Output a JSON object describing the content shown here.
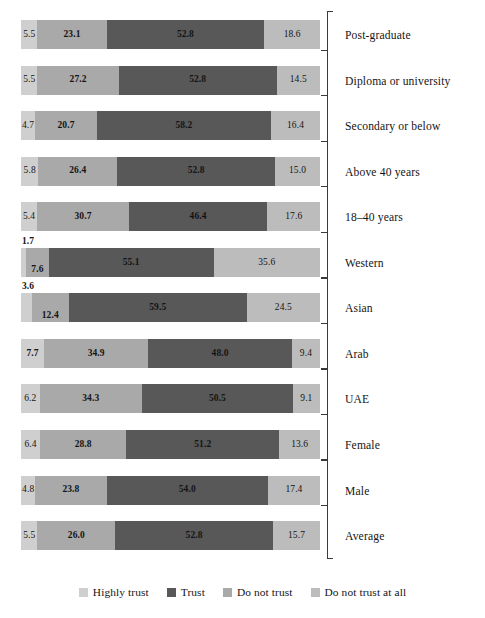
{
  "chart_data": {
    "type": "bar",
    "orientation": "horizontal",
    "stacked": true,
    "stack_mode": "percent",
    "title": "",
    "subtitle": "",
    "xlabel": "",
    "ylabel": "",
    "xlim": [
      0,
      100
    ],
    "grid": false,
    "legend_position": "bottom",
    "categories": [
      "Post-graduate",
      "Diploma or university",
      "Secondary or below",
      "Above 40 years",
      "18–40 years",
      "Western",
      "Asian",
      "Arab",
      "UAE",
      "Female",
      "Male",
      "Average"
    ],
    "series": [
      {
        "name": "Highly trust",
        "color": "#cfcfcf",
        "values": [
          5.5,
          5.5,
          4.7,
          5.8,
          5.4,
          1.7,
          3.6,
          7.7,
          6.2,
          6.4,
          4.8,
          5.5
        ]
      },
      {
        "name": "Trust",
        "color": "#a9a9a9",
        "values": [
          23.1,
          27.2,
          20.7,
          26.4,
          30.7,
          7.6,
          12.4,
          34.9,
          34.3,
          28.8,
          23.8,
          26.0
        ]
      },
      {
        "name": "Do not trust",
        "color": "#585858",
        "values": [
          52.8,
          52.8,
          58.2,
          52.8,
          46.4,
          55.1,
          59.5,
          48.0,
          50.5,
          51.2,
          54.0,
          52.8
        ]
      },
      {
        "name": "Do not trust at all",
        "color": "#bcbcbc",
        "values": [
          18.6,
          14.5,
          16.4,
          15.0,
          17.6,
          35.6,
          24.5,
          9.4,
          9.1,
          13.6,
          17.4,
          15.7
        ]
      }
    ],
    "rows": [
      {
        "label": "Post-graduate",
        "values": [
          {
            "value": "5.5",
            "bold": false,
            "placement": "inside"
          },
          {
            "value": "23.1",
            "bold": true,
            "placement": "inside"
          },
          {
            "value": "52.8",
            "bold": true,
            "placement": "inside"
          },
          {
            "value": "18.6",
            "bold": false,
            "placement": "inside"
          }
        ]
      },
      {
        "label": "Diploma or university",
        "values": [
          {
            "value": "5.5",
            "bold": false,
            "placement": "inside"
          },
          {
            "value": "27.2",
            "bold": true,
            "placement": "inside"
          },
          {
            "value": "52.8",
            "bold": true,
            "placement": "inside"
          },
          {
            "value": "14.5",
            "bold": false,
            "placement": "inside"
          }
        ]
      },
      {
        "label": "Secondary or below",
        "values": [
          {
            "value": "4.7",
            "bold": false,
            "placement": "inside"
          },
          {
            "value": "20.7",
            "bold": true,
            "placement": "inside"
          },
          {
            "value": "58.2",
            "bold": true,
            "placement": "inside"
          },
          {
            "value": "16.4",
            "bold": false,
            "placement": "inside"
          }
        ]
      },
      {
        "label": "Above 40 years",
        "values": [
          {
            "value": "5.8",
            "bold": false,
            "placement": "inside"
          },
          {
            "value": "26.4",
            "bold": true,
            "placement": "inside"
          },
          {
            "value": "52.8",
            "bold": true,
            "placement": "inside"
          },
          {
            "value": "15.0",
            "bold": false,
            "placement": "inside"
          }
        ]
      },
      {
        "label": "18–40 years",
        "values": [
          {
            "value": "5.4",
            "bold": false,
            "placement": "inside"
          },
          {
            "value": "30.7",
            "bold": true,
            "placement": "inside"
          },
          {
            "value": "46.4",
            "bold": true,
            "placement": "inside"
          },
          {
            "value": "17.6",
            "bold": false,
            "placement": "inside"
          }
        ]
      },
      {
        "label": "Western",
        "values": [
          {
            "value": "1.7",
            "bold": true,
            "placement": "above"
          },
          {
            "value": "7.6",
            "bold": true,
            "placement": "low"
          },
          {
            "value": "55.1",
            "bold": true,
            "placement": "inside"
          },
          {
            "value": "35.6",
            "bold": false,
            "placement": "inside"
          }
        ]
      },
      {
        "label": "Asian",
        "values": [
          {
            "value": "3.6",
            "bold": true,
            "placement": "above"
          },
          {
            "value": "12.4",
            "bold": true,
            "placement": "low"
          },
          {
            "value": "59.5",
            "bold": true,
            "placement": "inside"
          },
          {
            "value": "24.5",
            "bold": false,
            "placement": "inside"
          }
        ]
      },
      {
        "label": "Arab",
        "values": [
          {
            "value": "7.7",
            "bold": true,
            "placement": "inside"
          },
          {
            "value": "34.9",
            "bold": true,
            "placement": "inside"
          },
          {
            "value": "48.0",
            "bold": true,
            "placement": "inside"
          },
          {
            "value": "9.4",
            "bold": false,
            "placement": "inside"
          }
        ]
      },
      {
        "label": "UAE",
        "values": [
          {
            "value": "6.2",
            "bold": false,
            "placement": "inside"
          },
          {
            "value": "34.3",
            "bold": true,
            "placement": "inside"
          },
          {
            "value": "50.5",
            "bold": true,
            "placement": "inside"
          },
          {
            "value": "9.1",
            "bold": false,
            "placement": "inside"
          }
        ]
      },
      {
        "label": "Female",
        "values": [
          {
            "value": "6.4",
            "bold": false,
            "placement": "inside"
          },
          {
            "value": "28.8",
            "bold": true,
            "placement": "inside"
          },
          {
            "value": "51.2",
            "bold": true,
            "placement": "inside"
          },
          {
            "value": "13.6",
            "bold": false,
            "placement": "inside"
          }
        ]
      },
      {
        "label": "Male",
        "values": [
          {
            "value": "4.8",
            "bold": false,
            "placement": "inside"
          },
          {
            "value": "23.8",
            "bold": true,
            "placement": "inside"
          },
          {
            "value": "54.0",
            "bold": true,
            "placement": "inside"
          },
          {
            "value": "17.4",
            "bold": false,
            "placement": "inside"
          }
        ]
      },
      {
        "label": "Average",
        "values": [
          {
            "value": "5.5",
            "bold": false,
            "placement": "inside"
          },
          {
            "value": "26.0",
            "bold": true,
            "placement": "inside"
          },
          {
            "value": "52.8",
            "bold": true,
            "placement": "inside"
          },
          {
            "value": "15.7",
            "bold": false,
            "placement": "inside"
          }
        ]
      }
    ],
    "legend": [
      {
        "label": "Highly trust",
        "color": "#cfcfcf"
      },
      {
        "label": "Trust",
        "color": "#585858"
      },
      {
        "label": "Do not trust",
        "color": "#a9a9a9"
      },
      {
        "label": "Do not trust at all",
        "color": "#bcbcbc"
      }
    ]
  }
}
